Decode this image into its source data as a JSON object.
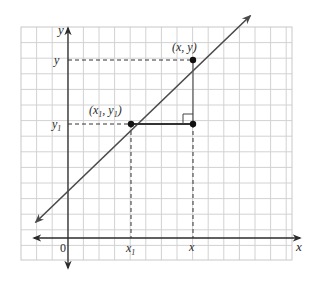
{
  "diagram": {
    "type": "coordinate-plane-line-slope",
    "grid": {
      "left": 21,
      "top": 27,
      "right": 292,
      "bottom": 260,
      "cell": 15.6,
      "line_color": "#cfcfcf",
      "border_color": "#c8c8c8"
    },
    "axes": {
      "color": "#2b2b2b",
      "origin_px": [
        68,
        238
      ],
      "x_axis_label": "x",
      "y_axis_label": "y",
      "origin_label": "0"
    },
    "points": {
      "p1": {
        "label_x": "x",
        "label_sub": "1",
        "label_y": "y",
        "label_y_sub": "1",
        "px": [
          131,
          124
        ]
      },
      "p2": {
        "label": "(x, y)",
        "px": [
          193,
          60
        ]
      },
      "corner": {
        "px": [
          193,
          124
        ]
      }
    },
    "tick_labels": {
      "x1": {
        "base": "x",
        "sub": "1"
      },
      "x": "x",
      "y1": {
        "base": "y",
        "sub": "1"
      },
      "y": "y"
    },
    "line": {
      "color": "#4a4a4a",
      "from_px": [
        36,
        222
      ],
      "to_px": [
        250,
        16
      ]
    },
    "colors": {
      "background": "#ffffff",
      "ink": "#222222",
      "dash": "#333333"
    }
  }
}
